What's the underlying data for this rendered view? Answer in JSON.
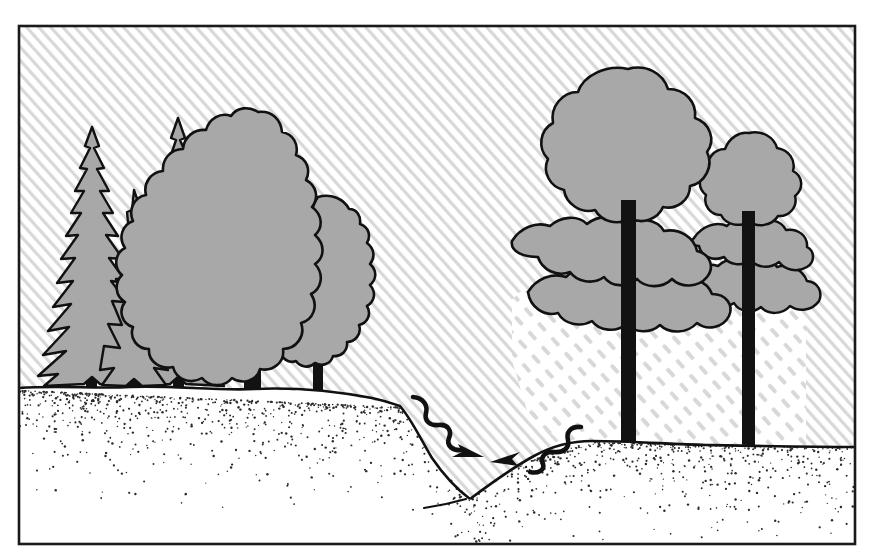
{
  "illustration": {
    "title": "Forested hillside with gully",
    "subject": "Line-art diagram of a mixed forest stand on a hill slope with an eroded gully in the center",
    "canvas": {
      "width": 874,
      "height": 558
    },
    "frame": {
      "name": "border-frame",
      "x": 18,
      "y": 25,
      "width": 838,
      "height": 520,
      "stroke_color": "#1a1a1a",
      "stroke_width": 2.5
    },
    "colors": {
      "paper": "#ffffff",
      "ink": "#111111",
      "foliage_gray": "#a8a8a8",
      "hatch_gray": "#d8d8d8",
      "stipple_gray": "#2b2b2b",
      "trunk_black": "#121212"
    },
    "background": {
      "solid_hatch": {
        "name": "solid-diagonal-hatch",
        "label": "Solid diagonal hatching",
        "direction": "lower-left to upper-right",
        "spacing_px": 9,
        "line_width_px": 3,
        "color": "#d8d8d8"
      },
      "dashed_hatch": {
        "name": "dashed-diagonal-hatch",
        "label": "Dashed diagonal hatching",
        "direction": "lower-left to upper-right",
        "spacing_px": 13,
        "dash_length_px": 11,
        "gap_length_px": 9,
        "line_width_px": 4,
        "color": "#d8d8d8",
        "region": {
          "x": 510,
          "y": 282,
          "width": 296,
          "height": 170
        }
      }
    },
    "ground": {
      "name": "ground-plane",
      "label": "Hill slope ground surface",
      "left_horizon_y": 389,
      "right_horizon_y": 446,
      "gully_bottom": {
        "x": 470,
        "y": 500
      },
      "stipple_texture": "Dense stippled dots fading downward from the horizon line",
      "stipple_dot_count": 2200
    },
    "gully": {
      "name": "gully-notch",
      "label": "Eroded gully / drainage notch",
      "apex": {
        "x": 470,
        "y": 498
      },
      "left_rim": {
        "x": 398,
        "y": 404
      },
      "right_rim": {
        "x": 592,
        "y": 441
      }
    },
    "arrows": [
      {
        "name": "water-flow-arrow-left",
        "label": "Wavy flow arrow pointing down-slope to the right",
        "direction": "down-right",
        "start": {
          "x": 417,
          "y": 398
        },
        "tip": {
          "x": 484,
          "y": 456
        }
      },
      {
        "name": "water-flow-arrow-right",
        "label": "Wavy flow arrow pointing down-slope to the left",
        "direction": "down-left",
        "start": {
          "x": 577,
          "y": 428
        },
        "tip": {
          "x": 492,
          "y": 461
        }
      }
    ],
    "tree_groups": [
      {
        "name": "left-stand",
        "label": "Left stand: conifers and broadleaf trees on upper slope",
        "species_note": "Spruce / fir conifers with jagged spire crowns plus rounded deciduous crowns",
        "tree_count": 5
      },
      {
        "name": "right-stand",
        "label": "Right stand: open-grown pines on lower slope",
        "species_note": "Pines with layered, spreading horizontal crown masses and exposed branching",
        "tree_count": 2
      }
    ],
    "trees": [
      {
        "name": "conifer-1",
        "type": "conifer",
        "label": "Tall spruce, leftmost",
        "apex": {
          "x": 92,
          "y": 127
        },
        "base": {
          "x": 92,
          "y": 389
        },
        "half_width": 56,
        "trunk_width": 10,
        "trunk_height": 26,
        "tiers": 11
      },
      {
        "name": "conifer-2",
        "type": "conifer",
        "label": "Short spruce, front left",
        "apex": {
          "x": 134,
          "y": 190
        },
        "base": {
          "x": 134,
          "y": 389
        },
        "half_width": 44,
        "trunk_width": 9,
        "trunk_height": 22,
        "tiers": 9
      },
      {
        "name": "conifer-3",
        "type": "conifer",
        "label": "Tall fir, behind deciduous crown",
        "apex": {
          "x": 178,
          "y": 118
        },
        "base": {
          "x": 178,
          "y": 389
        },
        "half_width": 52,
        "trunk_width": 10,
        "trunk_height": 26,
        "tiers": 11
      },
      {
        "name": "deciduous-1",
        "type": "deciduous",
        "label": "Large teardrop-crowned broadleaf tree",
        "crown_center": {
          "x": 257,
          "y": 247
        },
        "crown_rx": 68,
        "crown_ry": 131,
        "base": {
          "x": 252,
          "y": 389
        },
        "trunk_width": 16,
        "trunk_height": 40
      },
      {
        "name": "deciduous-2",
        "type": "deciduous",
        "label": "Smaller broadleaf tree with visible branch fork",
        "crown_center": {
          "x": 330,
          "y": 287
        },
        "crown_rx": 48,
        "crown_ry": 92,
        "base": {
          "x": 318,
          "y": 389
        },
        "trunk_width": 9,
        "trunk_height": 52
      },
      {
        "name": "pine-1",
        "type": "pine",
        "label": "Large open-grown pine, center right",
        "crown_center": {
          "x": 625,
          "y": 180
        },
        "base": {
          "x": 628,
          "y": 446
        },
        "trunk_width": 15,
        "trunk_height": 210,
        "crown_layers": 4
      },
      {
        "name": "pine-2",
        "type": "pine",
        "label": "Smaller open-grown pine, far right",
        "crown_center": {
          "x": 751,
          "y": 215
        },
        "base": {
          "x": 748,
          "y": 446
        },
        "trunk_width": 13,
        "trunk_height": 190,
        "crown_layers": 3
      }
    ]
  }
}
